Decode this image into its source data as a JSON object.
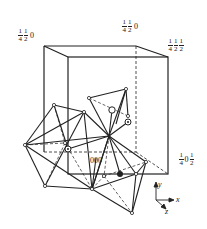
{
  "labels": {
    "top_left": {
      "a_num": "1",
      "a_den": "4",
      "b_num": "1",
      "b_den": "2",
      "c": "0"
    },
    "top_mid": {
      "a_num": "1",
      "a_den": "4",
      "b_num": "1",
      "b_den": "2",
      "c": "0"
    },
    "top_right": {
      "a_num": "1",
      "a_den": "4",
      "b_num": "1",
      "b_den": "2",
      "c_num": "1",
      "c_den": "2"
    },
    "right_mid": {
      "a_num": "1",
      "a_den": "4",
      "b": "0",
      "c_num": "1",
      "c_den": "2"
    },
    "origin": "000"
  },
  "axes": {
    "x": "x",
    "y": "y",
    "z": "z"
  },
  "colors": {
    "line": "#222222",
    "background": "#ffffff"
  }
}
